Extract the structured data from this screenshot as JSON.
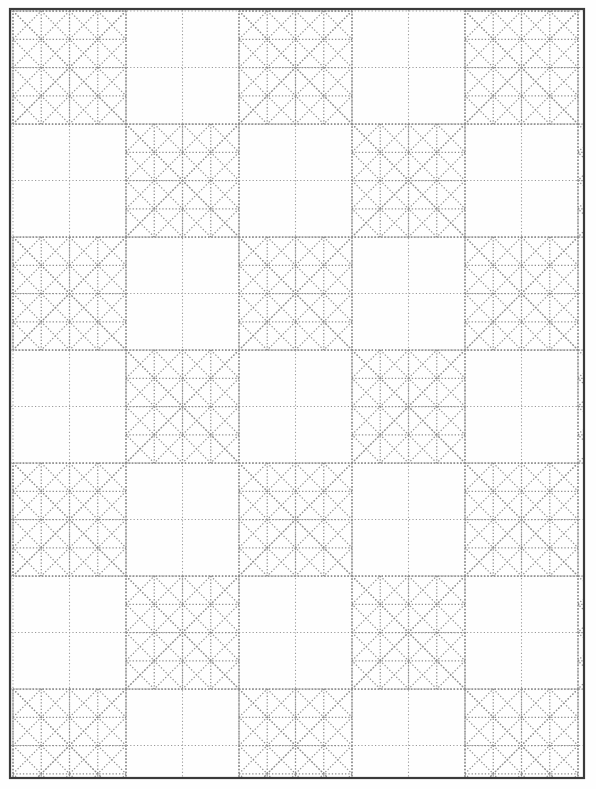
{
  "document": {
    "title": "Quilt Block Pattern Draft",
    "kind": "line-drawing",
    "description": "Repeating eight-pointed star quilt block pattern drawn in dotted construction lines inside a rectangular border"
  },
  "canvas": {
    "width": 596,
    "height": 789,
    "background_color": "#fefefe"
  },
  "frame": {
    "name": "page-border",
    "x": 10,
    "y": 9,
    "width": 574,
    "height": 769,
    "stroke_color": "#3a3a3a",
    "stroke_width": 2.2
  },
  "pattern": {
    "name": "eight-point-star-grid",
    "line_color": "#8c8c8c",
    "line_style": "dotted",
    "grid_color": "#9b9b9b",
    "cell_size": 56.5,
    "origin_x": 13,
    "origin_y": 11,
    "columns": 11,
    "rows": 15,
    "block_size_cells": 2,
    "star_points": 8,
    "star_centers_parity": "even",
    "notes": "Stars are centred on every second grid intersection in a checkerboard arrangement; each star spans two grid cells in each direction and is subdivided by diagonals, half-diagonals and internal squares."
  },
  "legend": {
    "visible": false,
    "entries": []
  }
}
